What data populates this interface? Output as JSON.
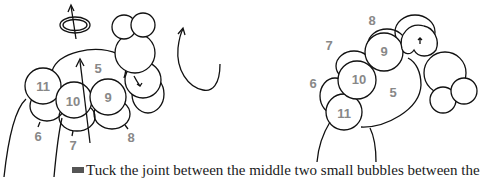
{
  "figure": {
    "left_view": {
      "labels": [
        {
          "id": "5",
          "x": 98,
          "y": 68
        },
        {
          "id": "11",
          "x": 43,
          "y": 86
        },
        {
          "id": "10",
          "x": 73,
          "y": 101
        },
        {
          "id": "9",
          "x": 108,
          "y": 97
        },
        {
          "id": "6",
          "x": 38,
          "y": 136
        },
        {
          "id": "7",
          "x": 73,
          "y": 145
        },
        {
          "id": "8",
          "x": 131,
          "y": 137
        }
      ],
      "icons": [
        "rotate-icon",
        "up-arrow-icon",
        "curved-arrow-icon"
      ]
    },
    "right_view": {
      "labels": [
        {
          "id": "8",
          "x": 372,
          "y": 20
        },
        {
          "id": "7",
          "x": 329,
          "y": 45
        },
        {
          "id": "9",
          "x": 384,
          "y": 51
        },
        {
          "id": "6",
          "x": 313,
          "y": 83
        },
        {
          "id": "10",
          "x": 359,
          "y": 79
        },
        {
          "id": "5",
          "x": 393,
          "y": 92
        },
        {
          "id": "11",
          "x": 344,
          "y": 113
        }
      ]
    },
    "caption": "Tuck the joint between the middle two small bubbles between the"
  },
  "colors": {
    "stroke": "#111111",
    "label": "#888888",
    "text": "#1a1a1a"
  }
}
